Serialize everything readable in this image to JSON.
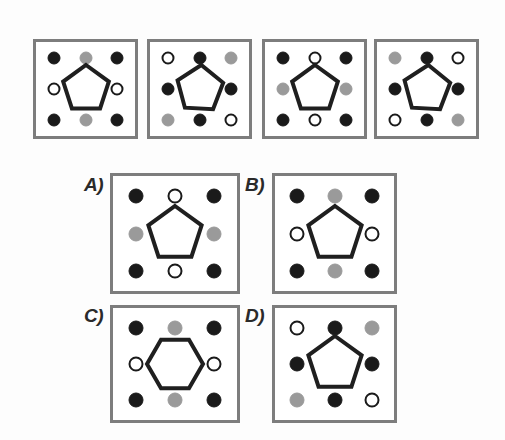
{
  "figure": {
    "type": "visual-analogy-matrix-puzzle",
    "colors": {
      "black": "#1a1a1a",
      "gray": "#9a9a9a",
      "white": "#ffffff",
      "panel_border": "#7d7d7d",
      "shape_stroke": "#1f1f1f",
      "background": "#fdfdfd"
    },
    "dot_positions": [
      "top-left",
      "top-center",
      "top-right",
      "middle-left",
      "middle-right",
      "bottom-left",
      "bottom-center",
      "bottom-right"
    ]
  },
  "sequence": {
    "name": "sequence-row",
    "panels": [
      {
        "id": "seq-1",
        "x": 33,
        "y": 39,
        "w": 105,
        "h": 100,
        "center_shape": "pentagon",
        "center_rotation": 0,
        "dots": {
          "top-left": "black",
          "top-center": "gray",
          "top-right": "black",
          "middle-left": "white",
          "middle-right": "white",
          "bottom-left": "black",
          "bottom-center": "gray",
          "bottom-right": "black"
        }
      },
      {
        "id": "seq-2",
        "x": 147,
        "y": 39,
        "w": 105,
        "h": 100,
        "center_shape": "pentagon",
        "center_rotation": 75,
        "dots": {
          "top-left": "white",
          "top-center": "black",
          "top-right": "gray",
          "middle-left": "black",
          "middle-right": "black",
          "bottom-left": "gray",
          "bottom-center": "black",
          "bottom-right": "white"
        }
      },
      {
        "id": "seq-3",
        "x": 262,
        "y": 39,
        "w": 105,
        "h": 100,
        "center_shape": "pentagon",
        "center_rotation": 0,
        "dots": {
          "top-left": "black",
          "top-center": "white",
          "top-right": "black",
          "middle-left": "gray",
          "middle-right": "gray",
          "bottom-left": "black",
          "bottom-center": "white",
          "bottom-right": "black"
        }
      },
      {
        "id": "seq-4",
        "x": 374,
        "y": 39,
        "w": 105,
        "h": 100,
        "center_shape": "pentagon",
        "center_rotation": 75,
        "dots": {
          "top-left": "gray",
          "top-center": "black",
          "top-right": "white",
          "middle-left": "black",
          "middle-right": "black",
          "bottom-left": "white",
          "bottom-center": "black",
          "bottom-right": "gray"
        }
      }
    ]
  },
  "options": {
    "name": "answer-options",
    "items": [
      {
        "id": "option-a",
        "label": "A)",
        "label_x": 84,
        "label_y": 174,
        "x": 110,
        "y": 173,
        "w": 130,
        "h": 121,
        "center_shape": "pentagon",
        "center_rotation": 0,
        "dots": {
          "top-left": "black",
          "top-center": "white",
          "top-right": "black",
          "middle-left": "gray",
          "middle-right": "gray",
          "bottom-left": "black",
          "bottom-center": "white",
          "bottom-right": "black"
        }
      },
      {
        "id": "option-b",
        "label": "B)",
        "label_x": 245,
        "label_y": 174,
        "x": 272,
        "y": 173,
        "w": 125,
        "h": 121,
        "center_shape": "pentagon",
        "center_rotation": 0,
        "dots": {
          "top-left": "black",
          "top-center": "gray",
          "top-right": "black",
          "middle-left": "white",
          "middle-right": "white",
          "bottom-left": "black",
          "bottom-center": "gray",
          "bottom-right": "black"
        }
      },
      {
        "id": "option-c",
        "label": "C)",
        "label_x": 84,
        "label_y": 305,
        "x": 110,
        "y": 305,
        "w": 130,
        "h": 118,
        "center_shape": "hexagon",
        "center_rotation": 0,
        "dots": {
          "top-left": "black",
          "top-center": "gray",
          "top-right": "black",
          "middle-left": "white",
          "middle-right": "white",
          "bottom-left": "black",
          "bottom-center": "gray",
          "bottom-right": "black"
        }
      },
      {
        "id": "option-d",
        "label": "D)",
        "label_x": 245,
        "label_y": 305,
        "x": 272,
        "y": 305,
        "w": 125,
        "h": 118,
        "center_shape": "pentagon",
        "center_rotation": 0,
        "dots": {
          "top-left": "white",
          "top-center": "black",
          "top-right": "gray",
          "middle-left": "black",
          "middle-right": "black",
          "bottom-left": "gray",
          "bottom-center": "black",
          "bottom-right": "white"
        }
      }
    ]
  }
}
